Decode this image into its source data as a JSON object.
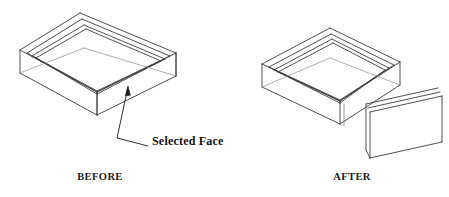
{
  "figure": {
    "background_color": "#ffffff",
    "line_color": "#3c3c3c",
    "text_color": "#111111",
    "width": 449,
    "height": 197
  },
  "captions": {
    "before": "BEFORE",
    "after": "AFTER"
  },
  "annotation": {
    "label": "Selected Face",
    "leader": {
      "arrow_tip_x": 128,
      "arrow_tip_y": 87,
      "elbow_x": 117,
      "elbow_y": 138,
      "end_x": 148,
      "end_y": 146
    }
  },
  "before_model": {
    "name": "tray-intact",
    "description": "Isometric rectangular tray with four walls, all faces attached",
    "top_apex_x": 80,
    "top_apex_y": 13,
    "left_x": 20,
    "right_x": 176,
    "bottom_y": 115
  },
  "after_model": {
    "name": "tray-face-removed",
    "description": "Isometric rectangular tray with front-right wall face detached",
    "top_apex_x": 330,
    "top_apex_y": 28,
    "left_x": 262,
    "right_x": 400,
    "bottom_y": 132
  },
  "detached_plate": {
    "name": "removed-face-plate",
    "description": "Thin rectangular wall panel separated from the tray",
    "top_left_x": 366,
    "top_left_y": 104,
    "top_right_x": 438,
    "top_right_y": 88,
    "height": 46
  }
}
